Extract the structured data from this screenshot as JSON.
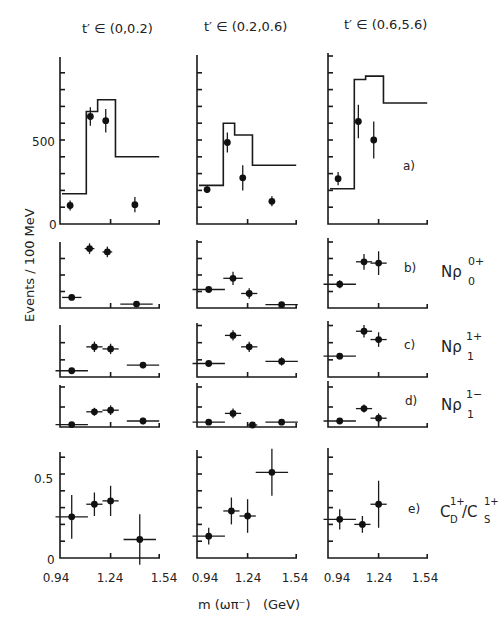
{
  "figure": {
    "ylabel": "Events / 100 MeV",
    "xlabel": "m (ωπ⁻)   (GeV)",
    "column_titles": [
      "t′ ∈ (0,0.2)",
      "t′ ∈ (0.2,0.6)",
      "t′ ∈ (0.6,5.6)"
    ],
    "x_ticks": [
      "0.94",
      "1.24",
      "1.54"
    ],
    "panel_labels": [
      "a)",
      "b)",
      "c)",
      "d)",
      "e)"
    ],
    "row_labels": [
      {
        "main": "Nρ",
        "sup": "0+",
        "sub": "0"
      },
      {
        "main": "Nρ",
        "sup": "1+",
        "sub": "1"
      },
      {
        "main": "Nρ",
        "sup": "1−",
        "sub": "1"
      },
      {
        "main": "C",
        "sup": "1+",
        "sub": "D",
        "main2": "/C",
        "sup2": "1+",
        "sub2": "S"
      }
    ],
    "y_ticks_a": [
      "0",
      "500"
    ],
    "y_ticks_e": [
      "0",
      "0.5"
    ]
  },
  "chart_data": {
    "type": "scatter",
    "title": "",
    "xlabel": "m(ωπ⁻) (GeV)",
    "ylabel": "Events / 100 MeV",
    "xlim": [
      0.94,
      1.54
    ],
    "x_ticks": [
      0.94,
      1.24,
      1.54
    ],
    "columns": [
      "t′ ∈ (0,0.2)",
      "t′ ∈ (0.2,0.6)",
      "t′ ∈ (0.6,5.6)"
    ],
    "panels": [
      {
        "label": "a)",
        "description": "Total events with histogram",
        "ylim": [
          0,
          1000
        ],
        "y_ticks": [
          0,
          500
        ],
        "histogram_bins": [
          0.94,
          1.09,
          1.16,
          1.27,
          1.54
        ],
        "histogram": [
          [
            180,
            670,
            740,
            400
          ],
          [
            230,
            600,
            530,
            350
          ],
          [
            210,
            860,
            880,
            720
          ]
        ],
        "points": [
          [
            {
              "x": 0.99,
              "y": 110,
              "err": 30
            },
            {
              "x": 1.115,
              "y": 640,
              "err": 55
            },
            {
              "x": 1.21,
              "y": 615,
              "err": 70
            },
            {
              "x": 1.39,
              "y": 115,
              "err": 45
            }
          ],
          [
            {
              "x": 0.99,
              "y": 205,
              "err": 20
            },
            {
              "x": 1.115,
              "y": 485,
              "err": 60
            },
            {
              "x": 1.21,
              "y": 275,
              "err": 75
            },
            {
              "x": 1.39,
              "y": 135,
              "err": 30
            }
          ],
          [
            {
              "x": 0.99,
              "y": 270,
              "err": 40
            },
            {
              "x": 1.115,
              "y": 610,
              "err": 100
            },
            {
              "x": 1.21,
              "y": 500,
              "err": 110
            }
          ]
        ]
      },
      {
        "label": "b)",
        "name": "Nρ₀⁰⁺",
        "points": [
          [
            {
              "x": 1.0,
              "y": 0.16,
              "err": 0.04,
              "xerr": 0.06
            },
            {
              "x": 1.11,
              "y": 0.9,
              "err": 0.08,
              "xerr": 0.03
            },
            {
              "x": 1.22,
              "y": 0.85,
              "err": 0.08,
              "xerr": 0.03
            },
            {
              "x": 1.4,
              "y": 0.06,
              "err": 0.04,
              "xerr": 0.1
            }
          ],
          [
            {
              "x": 1.0,
              "y": 0.28,
              "err": 0.02,
              "xerr": 0.1
            },
            {
              "x": 1.15,
              "y": 0.45,
              "err": 0.1,
              "xerr": 0.06
            },
            {
              "x": 1.25,
              "y": 0.22,
              "err": 0.08,
              "xerr": 0.05
            },
            {
              "x": 1.45,
              "y": 0.05,
              "err": 0.04,
              "xerr": 0.1
            }
          ],
          [
            {
              "x": 1.0,
              "y": 0.36,
              "err": 0.06,
              "xerr": 0.1
            },
            {
              "x": 1.15,
              "y": 0.7,
              "err": 0.12,
              "xerr": 0.05
            },
            {
              "x": 1.24,
              "y": 0.68,
              "err": 0.18,
              "xerr": 0.05
            }
          ]
        ]
      },
      {
        "label": "c)",
        "name": "Nρ₁¹⁺",
        "points": [
          [
            {
              "x": 1.0,
              "y": 0.12,
              "err": 0.04,
              "xerr": 0.1
            },
            {
              "x": 1.14,
              "y": 0.58,
              "err": 0.1,
              "xerr": 0.05
            },
            {
              "x": 1.24,
              "y": 0.54,
              "err": 0.1,
              "xerr": 0.05
            },
            {
              "x": 1.44,
              "y": 0.23,
              "err": 0.06,
              "xerr": 0.1
            }
          ],
          [
            {
              "x": 1.0,
              "y": 0.26,
              "err": 0.03,
              "xerr": 0.1
            },
            {
              "x": 1.15,
              "y": 0.8,
              "err": 0.1,
              "xerr": 0.05
            },
            {
              "x": 1.25,
              "y": 0.58,
              "err": 0.1,
              "xerr": 0.05
            },
            {
              "x": 1.45,
              "y": 0.3,
              "err": 0.08,
              "xerr": 0.1
            }
          ],
          [
            {
              "x": 1.0,
              "y": 0.4,
              "err": 0.06,
              "xerr": 0.1
            },
            {
              "x": 1.15,
              "y": 0.88,
              "err": 0.12,
              "xerr": 0.05
            },
            {
              "x": 1.24,
              "y": 0.72,
              "err": 0.14,
              "xerr": 0.05
            }
          ]
        ]
      },
      {
        "label": "d)",
        "name": "Nρ₁¹⁻",
        "points": [
          [
            {
              "x": 1.0,
              "y": 0.06,
              "err": 0.04,
              "xerr": 0.1
            },
            {
              "x": 1.14,
              "y": 0.38,
              "err": 0.1,
              "xerr": 0.05
            },
            {
              "x": 1.24,
              "y": 0.42,
              "err": 0.12,
              "xerr": 0.05
            },
            {
              "x": 1.44,
              "y": 0.15,
              "err": 0.08,
              "xerr": 0.1
            }
          ],
          [
            {
              "x": 1.0,
              "y": 0.12,
              "err": 0.05,
              "xerr": 0.1
            },
            {
              "x": 1.15,
              "y": 0.34,
              "err": 0.12,
              "xerr": 0.05
            },
            {
              "x": 1.27,
              "y": 0.05,
              "err": 0.04,
              "xerr": 0.03
            },
            {
              "x": 1.45,
              "y": 0.12,
              "err": 0.05,
              "xerr": 0.1
            }
          ],
          [
            {
              "x": 1.0,
              "y": 0.15,
              "err": 0.05,
              "xerr": 0.1
            },
            {
              "x": 1.15,
              "y": 0.46,
              "err": 0.1,
              "xerr": 0.05
            },
            {
              "x": 1.24,
              "y": 0.22,
              "err": 0.12,
              "xerr": 0.05
            }
          ]
        ]
      },
      {
        "label": "e)",
        "name": "C_D¹⁺/C_S¹⁺",
        "ylim": [
          0,
          0.64
        ],
        "y_ticks": [
          0,
          0.5
        ],
        "points": [
          [
            {
              "x": 1.0,
              "y": 0.245,
              "err": 0.13,
              "xerr": 0.1
            },
            {
              "x": 1.14,
              "y": 0.32,
              "err": 0.07,
              "xerr": 0.05
            },
            {
              "x": 1.24,
              "y": 0.34,
              "err": 0.09,
              "xerr": 0.05
            },
            {
              "x": 1.42,
              "y": 0.11,
              "err": 0.15,
              "xerr": 0.1
            }
          ],
          [
            {
              "x": 1.0,
              "y": 0.13,
              "err": 0.05,
              "xerr": 0.1
            },
            {
              "x": 1.14,
              "y": 0.28,
              "err": 0.08,
              "xerr": 0.05
            },
            {
              "x": 1.24,
              "y": 0.25,
              "err": 0.1,
              "xerr": 0.05
            },
            {
              "x": 1.39,
              "y": 0.51,
              "err": 0.14,
              "xerr": 0.1
            }
          ],
          [
            {
              "x": 1.0,
              "y": 0.23,
              "err": 0.06,
              "xerr": 0.1
            },
            {
              "x": 1.14,
              "y": 0.2,
              "err": 0.05,
              "xerr": 0.05
            },
            {
              "x": 1.24,
              "y": 0.32,
              "err": 0.14,
              "xerr": 0.05
            }
          ]
        ]
      }
    ]
  }
}
